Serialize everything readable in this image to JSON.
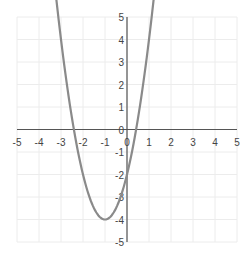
{
  "chart_data": {
    "type": "line",
    "title": "",
    "xlabel": "",
    "ylabel": "",
    "xlim": [
      -5,
      5
    ],
    "ylim": [
      -5,
      5
    ],
    "grid": true,
    "x_ticks": [
      "-5",
      "-4",
      "-3",
      "-2",
      "-1",
      "0",
      "1",
      "2",
      "3",
      "4",
      "5"
    ],
    "y_ticks": [
      "5",
      "4",
      "3",
      "2",
      "1",
      "0",
      "-1",
      "-2",
      "-3",
      "-4",
      "-5"
    ],
    "series": [
      {
        "name": "y = x^2 + 2x - 3",
        "color": "#8a8a8a",
        "x": [
          -4,
          -3.5,
          -3,
          -2.5,
          -2,
          -1.5,
          -1,
          -0.5,
          0,
          0.5,
          1,
          1.5,
          2
        ],
        "y": [
          5,
          2.25,
          0,
          -1.75,
          -3,
          -3.75,
          -4,
          -3.75,
          -3,
          -1.75,
          0,
          2.25,
          5
        ]
      }
    ],
    "annotations": {
      "roots": [
        -3,
        1
      ],
      "vertex": [
        -1,
        -4
      ],
      "y_intercept": -3
    }
  },
  "colors": {
    "curve": "#8a8a8a",
    "axis": "#555555",
    "grid": "#ececec",
    "label": "#444444"
  }
}
